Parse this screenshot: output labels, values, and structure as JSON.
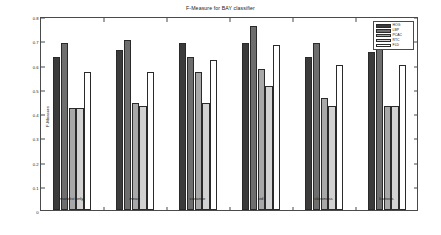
{
  "chart_data": {
    "type": "bar",
    "title": "F-Measure for BAY classifier",
    "xlabel": "",
    "ylabel": "F-Measure",
    "ylim": [
      0,
      0.8
    ],
    "yticks": [
      0,
      0.1,
      0.2,
      0.3,
      0.4,
      0.5,
      0.6,
      0.7,
      0.8
    ],
    "ytick_labels": [
      "0",
      "0.1",
      "0.2",
      "0.3",
      "0.4",
      "0.5",
      "0.6",
      "0.7",
      "0.8"
    ],
    "grid": false,
    "legend_position": "upper right",
    "categories": [
      "mandist only",
      "mean",
      "variance",
      "std",
      "skewness",
      "kurtosis"
    ],
    "series": [
      {
        "name": "HOG",
        "color": "#3b3b3b",
        "values": [
          0.63,
          0.66,
          0.69,
          0.69,
          0.63,
          0.65
        ]
      },
      {
        "name": "LBP",
        "color": "#6e6e6e",
        "values": [
          0.69,
          0.7,
          0.63,
          0.76,
          0.69,
          0.69
        ]
      },
      {
        "name": "PCAC",
        "color": "#a8a8a8",
        "values": [
          0.42,
          0.44,
          0.57,
          0.58,
          0.46,
          0.43
        ]
      },
      {
        "name": "RTC",
        "color": "#d2d2d2",
        "values": [
          0.42,
          0.43,
          0.44,
          0.51,
          0.43,
          0.43
        ]
      },
      {
        "name": "FLD",
        "color": "#ffffff",
        "values": [
          0.57,
          0.57,
          0.62,
          0.68,
          0.6,
          0.6
        ]
      }
    ]
  }
}
